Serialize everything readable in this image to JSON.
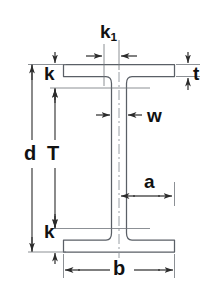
{
  "diagram": {
    "colors": {
      "outline": "#5a5f66",
      "dimension_line": "#2b2b2b",
      "label_text": "#111111",
      "background": "#ffffff"
    },
    "labels": {
      "k1": {
        "text": "k",
        "subscript": "1",
        "meaning": "half-width of web fillet zone at top flange"
      },
      "t": {
        "text": "t",
        "meaning": "flange thickness"
      },
      "k_top": {
        "text": "k",
        "meaning": "distance from outer flange face to web fillet toe (top)"
      },
      "w": {
        "text": "w",
        "meaning": "web thickness"
      },
      "d": {
        "text": "d",
        "meaning": "overall section depth"
      },
      "T": {
        "text": "T",
        "meaning": "clear web depth between fillets"
      },
      "a": {
        "text": "a",
        "meaning": "distance from web centerline to flange edge"
      },
      "k_bot": {
        "text": "k",
        "meaning": "distance from outer flange face to web fillet toe (bottom)"
      },
      "b": {
        "text": "b",
        "meaning": "flange width"
      }
    }
  }
}
